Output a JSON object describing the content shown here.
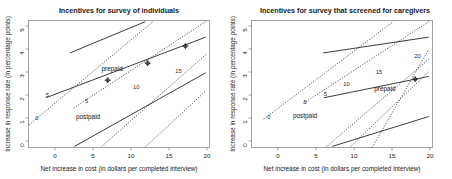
{
  "figure": {
    "panels": [
      {
        "id": "left",
        "title": "Incentives for survey of individuals",
        "xlabel": "Net increase in cost (in dollars per completed interview)",
        "ylabel": "Increase in response rate (in percentage points)",
        "xticks": [
          "0",
          "5",
          "10",
          "15",
          "20"
        ],
        "yticks": [
          "0",
          "1",
          "2",
          "3",
          "4",
          "5"
        ],
        "annotations": [
          "prepaid",
          "postpaid"
        ],
        "contour_labels": [
          "0",
          "5",
          "5",
          "10",
          "15"
        ]
      },
      {
        "id": "right",
        "title": "Incentives for survey that screened for caregivers",
        "xlabel": "Net increase in cost (in dollars per completed interview)",
        "ylabel": "Increase in response rate (in percentage points)",
        "xticks": [
          "0",
          "5",
          "10",
          "15",
          "20"
        ],
        "yticks": [
          "0",
          "1",
          "2",
          "3",
          "4",
          "5"
        ],
        "annotations": [
          "prepaid",
          "postpaid"
        ],
        "contour_labels": [
          "0",
          "5",
          "5",
          "10",
          "15",
          "20"
        ]
      }
    ]
  },
  "chart_data": {
    "type": "line",
    "xlabel": "Net increase in cost (in dollars per completed interview)",
    "ylabel": "Increase in response rate (in percentage points)",
    "xlim": [
      -2.5,
      21.5
    ],
    "ylim": [
      -0.55,
      5.4
    ],
    "grid": false,
    "legend": "none",
    "panels": [
      {
        "name": "Incentives for survey of individuals",
        "series": [
          {
            "name": "prepaid-0",
            "style": "solid",
            "label": "",
            "points": [
              [
                3.0,
                3.88
              ],
              [
                13.0,
                5.35
              ]
            ]
          },
          {
            "name": "prepaid-5",
            "style": "solid",
            "label": "5",
            "points": [
              [
                -0.2,
                1.78
              ],
              [
                21.0,
                4.62
              ]
            ],
            "label_at": [
              0.0,
              1.8
            ],
            "markers": [
              [
                8.0,
                2.6
              ],
              [
                13.3,
                3.4
              ],
              [
                18.3,
                4.2
              ]
            ]
          },
          {
            "name": "prepaid-10",
            "style": "solid",
            "label": "",
            "points": [
              [
                3.6,
                -0.5
              ],
              [
                21.0,
                2.95
              ]
            ]
          },
          {
            "name": "postpaid-0",
            "style": "dotted",
            "label": "0",
            "points": [
              [
                -2.4,
                0.52
              ],
              [
                14.0,
                5.35
              ]
            ],
            "label_at": [
              -1.4,
              0.75
            ]
          },
          {
            "name": "postpaid-5",
            "style": "dotted",
            "label": "5",
            "points": [
              [
                3.5,
                1.3
              ],
              [
                21.0,
                5.35
              ]
            ],
            "label_at": [
              5.2,
              1.55
            ]
          },
          {
            "name": "postpaid-10",
            "style": "dotted",
            "label": "10",
            "points": [
              [
                7.2,
                -0.5
              ],
              [
                21.0,
                3.8
              ]
            ],
            "label_at": [
              11.8,
              2.2
            ]
          },
          {
            "name": "postpaid-15",
            "style": "dotted",
            "label": "15",
            "points": [
              [
                12.9,
                -0.55
              ],
              [
                21.0,
                2.1
              ]
            ],
            "label_at": [
              17.4,
              2.95
            ]
          }
        ],
        "annotations": [
          {
            "text": "prepaid",
            "x": 8.6,
            "y": 3.02
          },
          {
            "text": "postpaid",
            "x": 5.4,
            "y": 0.78
          }
        ]
      },
      {
        "name": "Incentives for survey that screened for caregivers",
        "series": [
          {
            "name": "prepaid-0",
            "style": "solid",
            "label": "",
            "points": [
              [
                7.0,
                3.88
              ],
              [
                21.0,
                4.62
              ]
            ]
          },
          {
            "name": "prepaid-5",
            "style": "solid",
            "label": "5",
            "points": [
              [
                7.1,
                1.78
              ],
              [
                21.0,
                2.78
              ]
            ],
            "label_at": [
              7.3,
              1.85
            ],
            "markers": [
              [
                19.2,
                2.65
              ]
            ]
          },
          {
            "name": "prepaid-10",
            "style": "solid",
            "label": "",
            "points": [
              [
                8.2,
                -0.5
              ],
              [
                21.0,
                0.9
              ]
            ]
          },
          {
            "name": "postpaid-0",
            "style": "dotted",
            "label": "0",
            "points": [
              [
                -0.9,
                0.78
              ],
              [
                16.3,
                5.35
              ]
            ],
            "label_at": [
              -0.2,
              0.8
            ]
          },
          {
            "name": "postpaid-5",
            "style": "dotted",
            "label": "5",
            "points": [
              [
                4.4,
                1.52
              ],
              [
                21.0,
                5.35
              ]
            ],
            "label_at": [
              4.6,
              1.5
            ]
          },
          {
            "name": "postpaid-10",
            "style": "dotted",
            "label": "10",
            "points": [
              [
                7.3,
                -0.55
              ],
              [
                21.0,
                3.58
              ]
            ],
            "label_at": [
              10.1,
              2.32
            ]
          },
          {
            "name": "postpaid-15",
            "style": "dotted",
            "label": "15",
            "points": [
              [
                10.5,
                -0.55
              ],
              [
                21.0,
                3.0
              ]
            ],
            "label_at": [
              14.4,
              2.9
            ]
          },
          {
            "name": "postpaid-20",
            "style": "dotted",
            "label": "20",
            "points": [
              [
                13.5,
                -0.55
              ],
              [
                21.0,
                4.05
              ]
            ],
            "label_at": [
              19.5,
              3.62
            ]
          }
        ],
        "annotations": [
          {
            "text": "prepaid",
            "x": 15.2,
            "y": 2.08
          },
          {
            "text": "postpaid",
            "x": 4.6,
            "y": 0.82
          }
        ]
      }
    ]
  }
}
